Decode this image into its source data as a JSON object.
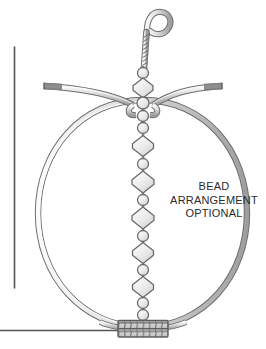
{
  "figure": {
    "type": "technical-line-illustration",
    "canvas": {
      "width": 266,
      "height": 349
    },
    "background_color": "#ffffff"
  },
  "caption": {
    "name": "bead-arrangement-note",
    "lines": [
      "BEAD",
      "ARRANGEMENT",
      "OPTIONAL"
    ],
    "line1": "BEAD",
    "line2": "ARRANGEMENT",
    "line3": "OPTIONAL",
    "color": "#2b2b2b",
    "font_size_px": 11,
    "align": "center"
  },
  "colors": {
    "wire_outline": "#6e6e6e",
    "wire_fill_light": "#f2f2f2",
    "wire_fill_mid": "#c9c9c9",
    "wire_fill_dark": "#9a9a9a",
    "wire_tip": "#7d7d7d",
    "bead_fill": "#ededed",
    "bead_fill_shadow": "#d8d8d8",
    "bead_outline": "#6b6b6b",
    "wrap_fill": "#c4c4c4",
    "wrap_outline": "#5e5e5e",
    "rule_line": "#555555",
    "text": "#2b2b2b"
  },
  "parts": {
    "hanging_loop": {
      "name": "hanging-loop",
      "shape": "teardrop loop",
      "center_x": 152,
      "center_y": 20,
      "radius": 12
    },
    "twisted_stem": {
      "name": "twisted-wire-stem",
      "x": 146,
      "top_y": 30,
      "bottom_y": 68,
      "twist_count": 9
    },
    "left_arm": {
      "name": "left-wire-arm",
      "start_x": 42,
      "start_y": 86,
      "end_x": 134,
      "end_y": 98,
      "tip_length": 18,
      "tip_color": "#7d7d7d"
    },
    "right_arm": {
      "name": "right-wire-arm",
      "start_x": 224,
      "start_y": 86,
      "end_x": 152,
      "end_y": 98,
      "tip_length": 18,
      "tip_color": "#7d7d7d"
    },
    "hoop": {
      "name": "wire-hoop",
      "center_x": 141,
      "center_y": 212,
      "radius_x": 104,
      "radius_y": 113,
      "stroke_width": 5
    },
    "bottom_wrap": {
      "name": "bottom-wire-wrap",
      "x": 118,
      "y": 320,
      "width": 50,
      "height": 17,
      "rows": 2,
      "columns": 8
    },
    "bead_column": {
      "name": "bead-column",
      "center_x": 143,
      "top_y": 66,
      "bottom_y": 322,
      "sequence": [
        {
          "type": "round",
          "cy": 73,
          "size": 11
        },
        {
          "type": "diamond",
          "cy": 88,
          "size": 20
        },
        {
          "type": "round",
          "cy": 103,
          "size": 12
        },
        {
          "type": "round",
          "cy": 116,
          "size": 11
        },
        {
          "type": "round",
          "cy": 128,
          "size": 11
        },
        {
          "type": "diamond",
          "cy": 146,
          "size": 21
        },
        {
          "type": "round",
          "cy": 164,
          "size": 11
        },
        {
          "type": "diamond",
          "cy": 182,
          "size": 22
        },
        {
          "type": "round",
          "cy": 200,
          "size": 11
        },
        {
          "type": "diamond",
          "cy": 218,
          "size": 22
        },
        {
          "type": "round",
          "cy": 236,
          "size": 11
        },
        {
          "type": "diamond",
          "cy": 253,
          "size": 21
        },
        {
          "type": "round",
          "cy": 270,
          "size": 11
        },
        {
          "type": "diamond",
          "cy": 287,
          "size": 21
        },
        {
          "type": "round",
          "cy": 303,
          "size": 11
        },
        {
          "type": "round",
          "cy": 315,
          "size": 11
        }
      ],
      "round_count": 9,
      "diamond_count": 7,
      "total_beads": 16
    },
    "vertical_rule": {
      "name": "vertical-rule-line",
      "x": 14,
      "y_top": 47,
      "y_bottom": 288,
      "color": "#555555"
    },
    "horizontal_rule": {
      "name": "horizontal-rule-line",
      "y": 330,
      "x_start": 0,
      "x_end": 120,
      "color": "#555555"
    }
  }
}
